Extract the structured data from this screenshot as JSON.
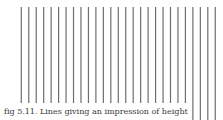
{
  "figure": {
    "caption": "fig 5.11. Lines giving an impression of height",
    "lines": {
      "count": 27,
      "first_x": 21.3,
      "spacing": 7.46,
      "top_y": 7,
      "short_bottom_y": 103,
      "long_bottom_y": 120,
      "long_line_count": 4,
      "stroke_width": 1.2,
      "color": "#6e6e6e"
    }
  }
}
